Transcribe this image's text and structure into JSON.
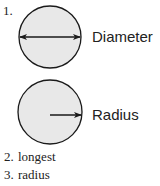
{
  "items": [
    {
      "number": "1.",
      "figures": [
        {
          "name": "diameter",
          "label": "Diameter"
        },
        {
          "name": "radius",
          "label": "Radius"
        }
      ]
    },
    {
      "number": "2.",
      "answer": "longest"
    },
    {
      "number": "3.",
      "answer": "radius"
    }
  ],
  "colors": {
    "circle_fill": "#e8e8e8",
    "stroke": "#1a1a1a"
  }
}
